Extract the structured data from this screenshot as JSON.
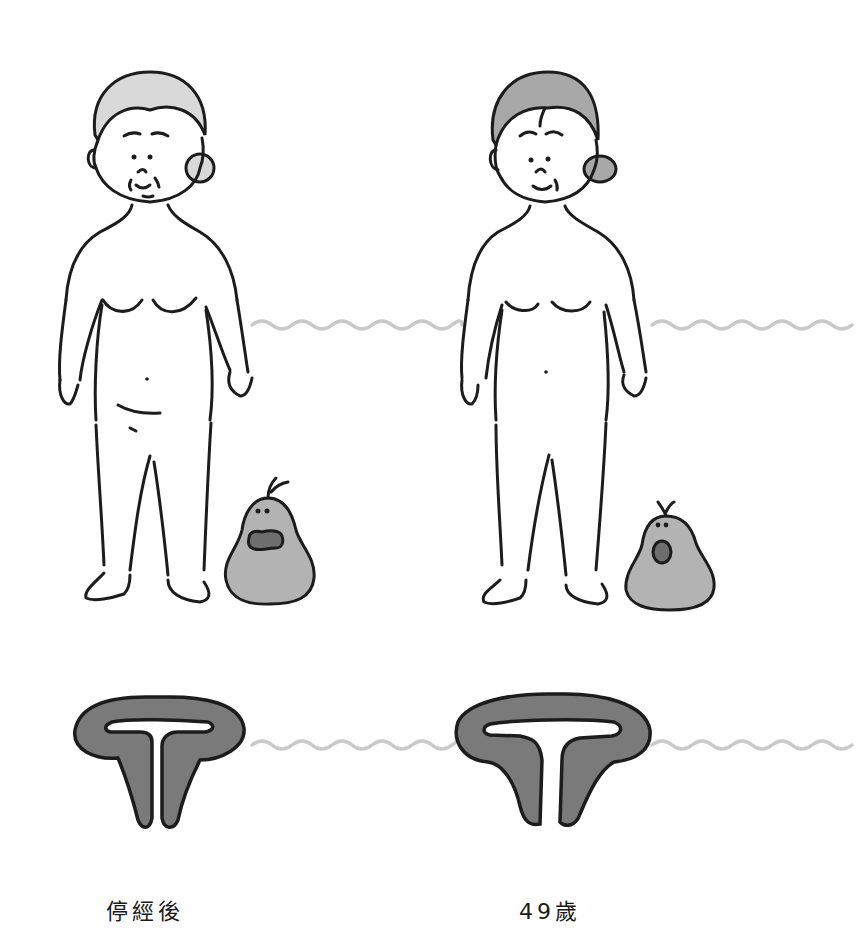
{
  "figure": {
    "type": "comparison-illustration",
    "colors": {
      "background": "#ffffff",
      "ink": "#1c1c1c",
      "hair_light": "#d9d9d9",
      "hair_dark": "#a8a8a8",
      "pear_fill": "#b3b3b3",
      "pear_mouth": "#6e6e6e",
      "organ_fill": "#7a7a7a",
      "wave": "#c9c9c9"
    },
    "panels": [
      {
        "id": "left",
        "label": "停經後",
        "figure": "older woman, lighter hair, rounder belly",
        "pear_expression": "wide open mouth (shocked)",
        "organ": "uterus, smaller"
      },
      {
        "id": "right",
        "label": "49歲",
        "figure": "middle-aged woman, darker hair, flatter belly",
        "pear_expression": "small round open mouth",
        "organ": "uterus, larger"
      }
    ]
  }
}
